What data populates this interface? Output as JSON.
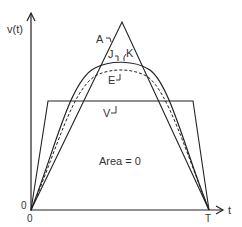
{
  "diagram": {
    "type": "waveform-comparison",
    "y_axis_label": "v(t)",
    "x_axis_label": "t",
    "origin_y_label": "0",
    "origin_x_label": "0",
    "end_time_label": "T",
    "annotation": "Area = 0",
    "curves": [
      {
        "id": "A",
        "label": "A",
        "shape": "triangle",
        "style": "solid"
      },
      {
        "id": "J",
        "label": "J",
        "shape": "smooth-arc",
        "style": "solid"
      },
      {
        "id": "K",
        "label": "K",
        "shape": "smooth-arc",
        "style": "solid"
      },
      {
        "id": "E",
        "label": "E",
        "shape": "smooth-arc",
        "style": "dashed"
      },
      {
        "id": "V",
        "label": "V",
        "shape": "trapezoid",
        "style": "solid"
      }
    ],
    "colors": {
      "line": "#222222",
      "text": "#333333",
      "background": "#ffffff"
    }
  }
}
